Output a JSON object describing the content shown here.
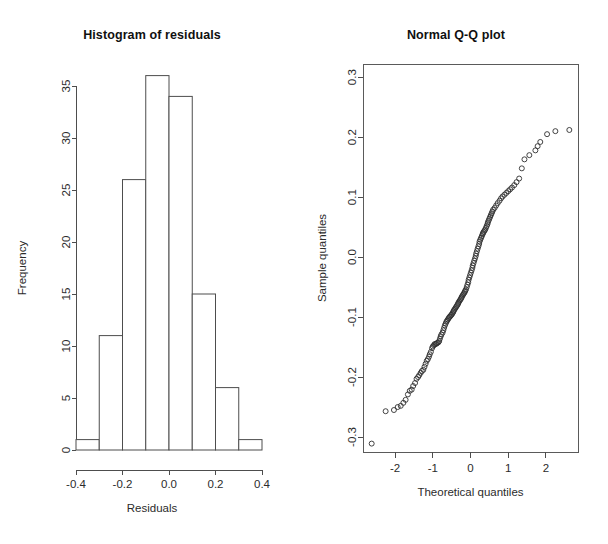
{
  "figure": {
    "background": "#ffffff",
    "foreground": "#1a1a1a",
    "width": 608,
    "height": 544,
    "panels": 2
  },
  "panel_hist": {
    "title": "Histogram of residuals",
    "xlabel": "Residuals",
    "ylabel": "Frequency"
  },
  "panel_qq": {
    "title": "Normal Q-Q plot",
    "xlabel": "Theoretical quantiles",
    "ylabel": "Sample quantiles"
  },
  "chart_data": [
    {
      "type": "bar",
      "subtype": "histogram",
      "title": "Histogram of residuals",
      "xlabel": "Residuals",
      "ylabel": "Frequency",
      "xlim": [
        -0.4,
        0.4
      ],
      "ylim": [
        0,
        36
      ],
      "grid": false,
      "legend": false,
      "bin_width": 0.1,
      "bin_edges": [
        -0.4,
        -0.3,
        -0.2,
        -0.1,
        0.0,
        0.1,
        0.2,
        0.3,
        0.4
      ],
      "categories": [
        "-0.4 to -0.3",
        "-0.3 to -0.2",
        "-0.2 to -0.1",
        "-0.1 to 0.0",
        "0.0 to 0.1",
        "0.1 to 0.2",
        "0.2 to 0.3",
        "0.3 to 0.4"
      ],
      "values": [
        1,
        11,
        26,
        36,
        34,
        15,
        6,
        1
      ],
      "total_count": 130,
      "xticks": [
        -0.4,
        -0.2,
        0.0,
        0.2,
        0.4
      ],
      "xtick_labels": [
        "-0.4",
        "-0.2",
        "0.0",
        "0.2",
        "0.4"
      ],
      "yticks": [
        0,
        5,
        10,
        15,
        20,
        25,
        30,
        35
      ],
      "ytick_labels": [
        "0",
        "5",
        "10",
        "15",
        "20",
        "25",
        "30",
        "35"
      ]
    },
    {
      "type": "scatter",
      "subtype": "qq-plot",
      "title": "Normal Q-Q plot",
      "xlabel": "Theoretical quantiles",
      "ylabel": "Sample quantiles",
      "xlim": [
        -2.85,
        2.85
      ],
      "ylim": [
        -0.325,
        0.322
      ],
      "grid": false,
      "legend": false,
      "marker": "open-circle",
      "n_points": 130,
      "xticks": [
        -2,
        -1,
        0,
        1,
        2
      ],
      "xtick_labels": [
        "-2",
        "-1",
        "0",
        "1",
        "2"
      ],
      "yticks": [
        0.3,
        0.2,
        0.1,
        0.0,
        -0.1,
        -0.2,
        -0.3
      ],
      "ytick_labels": [
        "0.3",
        "0.2",
        "0.1",
        "0.0",
        "-0.1",
        "-0.2",
        "-0.3"
      ],
      "x": [
        -2.62,
        -2.25,
        -2.03,
        -1.93,
        -1.85,
        -1.78,
        -1.72,
        -1.66,
        -1.61,
        -1.56,
        -1.52,
        -1.47,
        -1.43,
        -1.39,
        -1.36,
        -1.32,
        -1.29,
        -1.25,
        -1.22,
        -1.19,
        -1.16,
        -1.13,
        -1.1,
        -1.08,
        -1.05,
        -1.02,
        -1.0,
        -0.97,
        -0.95,
        -0.92,
        -0.9,
        -0.88,
        -0.85,
        -0.83,
        -0.81,
        -0.79,
        -0.77,
        -0.74,
        -0.72,
        -0.7,
        -0.68,
        -0.66,
        -0.64,
        -0.62,
        -0.6,
        -0.58,
        -0.56,
        -0.54,
        -0.52,
        -0.5,
        -0.48,
        -0.46,
        -0.45,
        -0.43,
        -0.41,
        -0.39,
        -0.37,
        -0.35,
        -0.33,
        -0.32,
        -0.3,
        -0.28,
        -0.26,
        -0.24,
        -0.23,
        -0.21,
        -0.19,
        -0.17,
        -0.15,
        -0.14,
        -0.12,
        -0.1,
        -0.08,
        -0.06,
        -0.05,
        -0.03,
        -0.01,
        0.01,
        0.03,
        0.05,
        0.06,
        0.08,
        0.1,
        0.12,
        0.14,
        0.15,
        0.17,
        0.19,
        0.21,
        0.23,
        0.24,
        0.26,
        0.28,
        0.3,
        0.32,
        0.33,
        0.35,
        0.37,
        0.39,
        0.41,
        0.43,
        0.45,
        0.46,
        0.48,
        0.5,
        0.52,
        0.54,
        0.56,
        0.58,
        0.6,
        0.64,
        0.68,
        0.72,
        0.77,
        0.81,
        0.85,
        0.9,
        0.95,
        1.0,
        1.05,
        1.1,
        1.16,
        1.22,
        1.29,
        1.36,
        1.43,
        1.56,
        1.72,
        1.78,
        1.85,
        2.03,
        2.25,
        2.62
      ],
      "y": [
        -0.311,
        -0.257,
        -0.255,
        -0.25,
        -0.248,
        -0.243,
        -0.238,
        -0.229,
        -0.223,
        -0.221,
        -0.215,
        -0.21,
        -0.203,
        -0.2,
        -0.197,
        -0.193,
        -0.19,
        -0.188,
        -0.183,
        -0.178,
        -0.173,
        -0.17,
        -0.166,
        -0.162,
        -0.158,
        -0.152,
        -0.149,
        -0.147,
        -0.145,
        -0.145,
        -0.144,
        -0.143,
        -0.142,
        -0.14,
        -0.136,
        -0.132,
        -0.129,
        -0.126,
        -0.122,
        -0.118,
        -0.114,
        -0.111,
        -0.108,
        -0.106,
        -0.104,
        -0.102,
        -0.1,
        -0.099,
        -0.097,
        -0.096,
        -0.094,
        -0.092,
        -0.09,
        -0.088,
        -0.086,
        -0.084,
        -0.082,
        -0.08,
        -0.078,
        -0.076,
        -0.074,
        -0.072,
        -0.07,
        -0.068,
        -0.066,
        -0.064,
        -0.062,
        -0.06,
        -0.058,
        -0.056,
        -0.054,
        -0.05,
        -0.046,
        -0.042,
        -0.038,
        -0.034,
        -0.03,
        -0.026,
        -0.022,
        -0.018,
        -0.014,
        -0.01,
        -0.006,
        -0.002,
        0.002,
        0.006,
        0.01,
        0.014,
        0.018,
        0.022,
        0.026,
        0.029,
        0.032,
        0.035,
        0.038,
        0.04,
        0.042,
        0.044,
        0.046,
        0.049,
        0.052,
        0.055,
        0.058,
        0.061,
        0.064,
        0.067,
        0.07,
        0.073,
        0.076,
        0.079,
        0.082,
        0.086,
        0.09,
        0.094,
        0.098,
        0.101,
        0.104,
        0.107,
        0.11,
        0.113,
        0.116,
        0.12,
        0.125,
        0.131,
        0.148,
        0.163,
        0.17,
        0.178,
        0.185,
        0.192,
        0.205,
        0.21,
        0.212
      ]
    }
  ]
}
